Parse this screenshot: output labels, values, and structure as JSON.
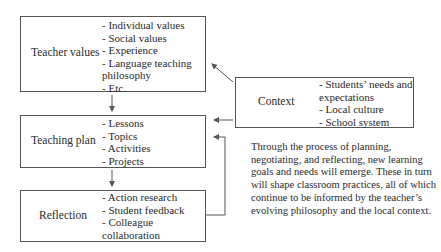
{
  "diagram": {
    "boxes": {
      "teacher_values": {
        "title": "Teacher values",
        "items": [
          "- Individual values",
          "- Social values",
          "- Experience",
          "- Language teaching",
          "philosophy",
          "- Etc."
        ]
      },
      "teaching_plan": {
        "title": "Teaching plan",
        "items": [
          "- Lessons",
          "- Topics",
          "- Activities",
          "- Projects"
        ]
      },
      "reflection": {
        "title": "Reflection",
        "items": [
          "- Action research",
          "- Student feedback",
          "- Colleague",
          "collaboration"
        ]
      },
      "context": {
        "title": "Context",
        "items": [
          "- Students’ needs and",
          "expectations",
          "- Local culture",
          "- School system"
        ]
      }
    },
    "paragraph": "Through the process of planning, negotiating, and reflecting, new learning goals and needs will emerge. These in turn will shape classroom practices, all of which continue to be informed by the teacher’s evolving philosophy and the local context.",
    "edges": [
      {
        "from": "Teacher values",
        "to": "Teaching plan"
      },
      {
        "from": "Teaching plan",
        "to": "Reflection"
      },
      {
        "from": "Reflection",
        "to": "Teaching plan"
      },
      {
        "from": "Context",
        "to": "Teacher values"
      },
      {
        "from": "Context",
        "to": "Teaching plan"
      }
    ],
    "colors": {
      "stroke": "#555555",
      "text": "#2a2a2a",
      "background": "#ffffff"
    }
  }
}
